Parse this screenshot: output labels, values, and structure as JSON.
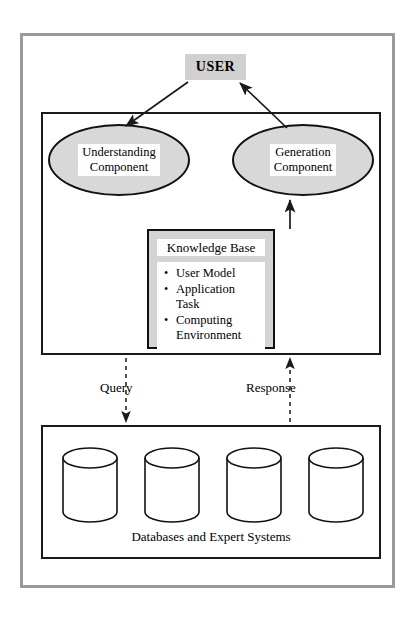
{
  "diagram": {
    "user_node": {
      "label": "USER",
      "fill": "#d0d0d0"
    },
    "components": [
      {
        "name": "understanding",
        "label": "Understanding\nComponent",
        "fill": "#d8d8d8"
      },
      {
        "name": "generation",
        "label": "Generation\nComponent",
        "fill": "#d8d8d8"
      }
    ],
    "knowledge_base": {
      "title": "Knowledge Base",
      "fill": "#d4d4d4",
      "items": [
        "User Model",
        "Application Task",
        "Computing\nEnvironment"
      ]
    },
    "flows": [
      {
        "name": "query",
        "label": "Query",
        "direction": "down"
      },
      {
        "name": "response",
        "label": "Response",
        "direction": "up"
      }
    ],
    "databases": {
      "caption": "Databases and Expert Systems",
      "cylinder_count": 4
    },
    "colors": {
      "outline": "#111111",
      "frame": "#9a9a9a",
      "background": "#ffffff"
    }
  }
}
